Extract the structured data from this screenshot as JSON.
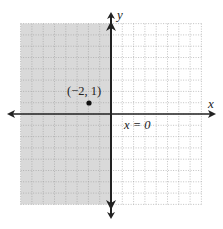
{
  "chart_data": {
    "type": "scatter",
    "title": "",
    "xlabel": "x",
    "ylabel": "y",
    "xlim": [
      -8,
      8
    ],
    "ylim": [
      -8,
      8
    ],
    "grid": true,
    "grid_style": "dotted",
    "legend": null,
    "shaded_region": {
      "description": "half-plane x < 0 shaded gray (left of y-axis)",
      "x_from": -8,
      "x_to": 0,
      "color": "#d9d9d9"
    },
    "boundary_line": {
      "equation": "x = 0",
      "label": "x = 0",
      "style": "solid"
    },
    "points": [
      {
        "x": -2,
        "y": 1,
        "label": "(−2, 1)"
      }
    ],
    "annotations": [
      "(−2, 1)",
      "x = 0"
    ]
  },
  "labels": {
    "x_axis": "x",
    "y_axis": "y",
    "point": "(−2, 1)",
    "boundary": "x = 0"
  },
  "colors": {
    "shade": "#d9d9d9",
    "grid": "#9a9a9a",
    "axis": "#222222",
    "point": "#111111"
  }
}
